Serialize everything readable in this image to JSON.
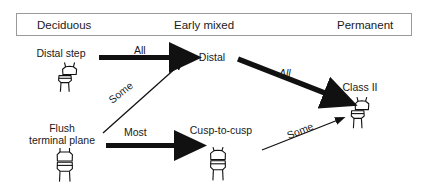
{
  "header": {
    "bar_border_color": "#9a9a9a",
    "stages": [
      {
        "label": "Deciduous"
      },
      {
        "label": "Early mixed"
      },
      {
        "label": "Permanent"
      }
    ]
  },
  "diagram": {
    "type": "flow-diagram",
    "ink_color": "#111111",
    "nodes": [
      {
        "id": "distal-step",
        "label": "Distal step",
        "stage": "Deciduous",
        "icon": "molar-distal-step-icon"
      },
      {
        "id": "flush",
        "label_line1": "Flush",
        "label_line2": "terminal plane",
        "stage": "Deciduous",
        "icon": "molar-flush-terminal-plane-icon"
      },
      {
        "id": "distal",
        "label": "Distal",
        "stage": "Early mixed",
        "icon": null
      },
      {
        "id": "cusp-to-cusp",
        "label": "Cusp-to-cusp",
        "stage": "Early mixed",
        "icon": "molar-cusp-to-cusp-icon"
      },
      {
        "id": "class-ii",
        "label": "Class II",
        "stage": "Permanent",
        "icon": "molar-class-ii-icon"
      }
    ],
    "edges": [
      {
        "id": "e1",
        "from": "distal-step",
        "to": "distal",
        "label": "All",
        "weight": "thick",
        "italic": false
      },
      {
        "id": "e2",
        "from": "flush",
        "to": "distal",
        "label": "Some",
        "weight": "thin",
        "italic": false
      },
      {
        "id": "e3",
        "from": "flush",
        "to": "cusp-to-cusp",
        "label": "Most",
        "weight": "thick",
        "italic": false
      },
      {
        "id": "e4",
        "from": "distal",
        "to": "class-ii",
        "label": "All",
        "weight": "thick",
        "italic": true
      },
      {
        "id": "e5",
        "from": "cusp-to-cusp",
        "to": "class-ii",
        "label": "Some",
        "weight": "thin",
        "italic": false
      }
    ]
  }
}
